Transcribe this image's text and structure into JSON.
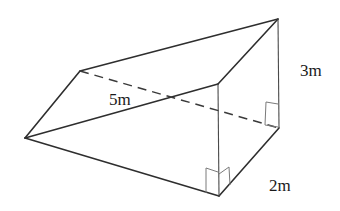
{
  "figure": {
    "type": "triangular-prism",
    "labels": {
      "height": "3m",
      "depth": "2m",
      "slant": "5m"
    },
    "colors": {
      "line": "#2e2e2e",
      "background": "#ffffff"
    }
  }
}
